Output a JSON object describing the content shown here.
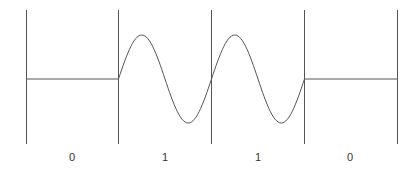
{
  "diagram": {
    "bits": [
      "0",
      "1",
      "1",
      "0"
    ],
    "line_color": "#555555",
    "boundaries_x": [
      26,
      118,
      211,
      304,
      397
    ],
    "baseline_y": 79,
    "amplitude": 44
  }
}
